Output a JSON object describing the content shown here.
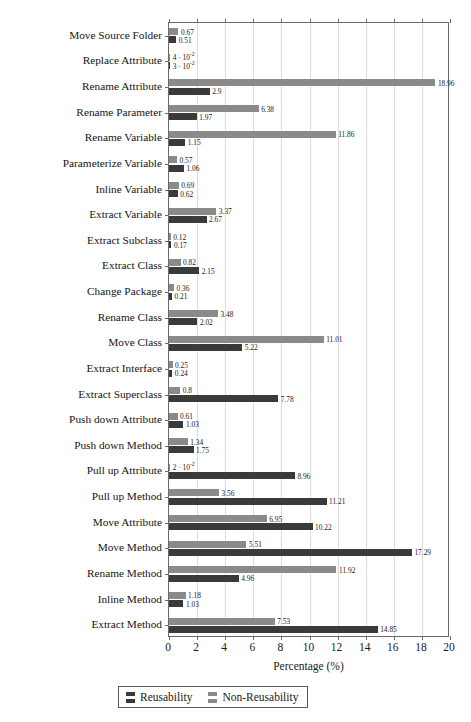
{
  "page": {
    "header_fragment": "",
    "background": "#ffffff"
  },
  "legend": {
    "entries": [
      {
        "label": "Reusability",
        "color": "#3a3a3a",
        "key": "reusability"
      },
      {
        "label": "Non-Reusability",
        "color": "#8a8a8a",
        "key": "non_reusability"
      }
    ]
  },
  "axis": {
    "x_title": "Percentage (%)",
    "x_ticks": [
      "0",
      "2",
      "4",
      "6",
      "8",
      "10",
      "12",
      "14",
      "16",
      "18",
      "20"
    ]
  },
  "chart_data": {
    "type": "bar",
    "orientation": "horizontal",
    "title": "",
    "xlabel": "Percentage (%)",
    "ylabel": "",
    "xlim": [
      0,
      20
    ],
    "xticks": [
      0,
      2,
      4,
      6,
      8,
      10,
      12,
      14,
      16,
      18,
      20
    ],
    "grid": true,
    "legend_position": "bottom",
    "categories": [
      "Move Source Folder",
      "Replace Attribute",
      "Rename Attribute",
      "Rename Parameter",
      "Rename Variable",
      "Parameterize Variable",
      "Inline Variable",
      "Extract Variable",
      "Extract Subclass",
      "Extract Class",
      "Change Package",
      "Rename Class",
      "Move Class",
      "Extract Interface",
      "Extract Superclass",
      "Push down Attribute",
      "Push down Method",
      "Pull up Attribute",
      "Pull up Method",
      "Move Attribute",
      "Move Method",
      "Rename Method",
      "Inline Method",
      "Extract Method"
    ],
    "series": [
      {
        "name": "Non-Reusability",
        "color": "#8a8a8a",
        "values": [
          0.67,
          0.04,
          18.96,
          6.38,
          11.86,
          0.57,
          0.69,
          3.37,
          0.12,
          0.82,
          0.36,
          3.48,
          11.01,
          0.25,
          0.8,
          0.61,
          1.34,
          0.02,
          3.56,
          6.95,
          5.51,
          11.92,
          1.18,
          7.53
        ],
        "labels": [
          "0.67",
          "4 · 10⁻²",
          "18.96",
          "6.38",
          "11.86",
          "0.57",
          "0.69",
          "3.37",
          "0.12",
          "0.82",
          "0.36",
          "3.48",
          "11.01",
          "0.25",
          "0.8",
          "0.61",
          "1.34",
          "2 · 10⁻²",
          "3.56",
          "6.95",
          "5.51",
          "11.92",
          "1.18",
          "7.53"
        ]
      },
      {
        "name": "Reusability",
        "color": "#3a3a3a",
        "values": [
          0.51,
          0.03,
          2.9,
          1.97,
          1.15,
          1.06,
          0.62,
          2.67,
          0.17,
          2.15,
          0.21,
          2.02,
          5.22,
          0.24,
          7.78,
          1.03,
          1.75,
          8.96,
          11.21,
          10.22,
          17.29,
          4.96,
          1.03,
          14.85
        ],
        "labels": [
          "0.51",
          "3 · 10⁻²",
          "2.9",
          "1.97",
          "1.15",
          "1.06",
          "0.62",
          "2.67",
          "0.17",
          "2.15",
          "0.21",
          "2.02",
          "5.22",
          "0.24",
          "7.78",
          "1.03",
          "1.75",
          "8.96",
          "11.21",
          "10.22",
          "17.29",
          "4.96",
          "1.03",
          "14.85"
        ]
      }
    ]
  }
}
